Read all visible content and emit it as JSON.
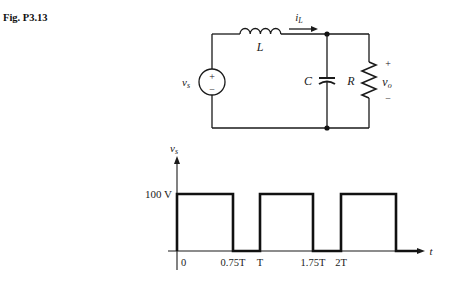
{
  "figure_label": "Fig. P3.13",
  "circuit": {
    "source_label": "v",
    "source_sub": "s",
    "source_plus": "+",
    "source_minus": "−",
    "inductor_label": "L",
    "current_label": "i",
    "current_sub": "L",
    "capacitor_label": "C",
    "resistor_label": "R",
    "output_plus": "+",
    "output_label": "v",
    "output_sub": "o",
    "output_minus": "−"
  },
  "chart_data": {
    "type": "line",
    "title": "",
    "ylabel": "v",
    "ylabel_sub": "s",
    "xlabel": "t",
    "y_level_label": "100 V",
    "x_ticks": [
      "0",
      "0.75T",
      "T",
      "1.75T",
      "2T"
    ],
    "x_tick_values": [
      0,
      0.75,
      1,
      1.75,
      2
    ],
    "x_units": "T",
    "y_units": "V",
    "series": [
      {
        "name": "v_s",
        "points": [
          [
            0,
            0
          ],
          [
            0,
            100
          ],
          [
            0.75,
            100
          ],
          [
            0.75,
            0
          ],
          [
            1,
            0
          ],
          [
            1,
            100
          ],
          [
            1.75,
            100
          ],
          [
            1.75,
            0
          ],
          [
            2,
            0
          ],
          [
            2,
            100
          ],
          [
            2.75,
            100
          ],
          [
            2.75,
            0
          ],
          [
            3,
            0
          ]
        ]
      }
    ],
    "ylim": [
      0,
      100
    ],
    "grid": false
  }
}
